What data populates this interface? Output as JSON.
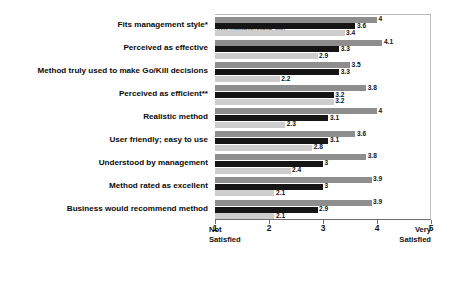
{
  "chart_data": {
    "type": "bar",
    "orientation": "horizontal",
    "title": "",
    "subtitle": "",
    "xlabel": "",
    "ylabel": "",
    "xlim": [
      1,
      5
    ],
    "xticks": [
      1,
      2,
      3,
      4,
      5
    ],
    "xtick_labels": [
      "1",
      "2",
      "3",
      "4",
      "5"
    ],
    "axis_low_label": "Not Satisfied",
    "axis_high_label": "Very Satisfied",
    "grid": false,
    "legend_position": "top-left-inside-plot",
    "categories": [
      "Fits management style*",
      "Perceived as effective",
      "Method truly used to make Go/Kill decisions",
      "Perceived as efficient**",
      "Realistic method",
      "User friendly; easy to use",
      "Understood by management",
      "Method rated as excellent",
      "Business would recommend method"
    ],
    "series": [
      {
        "name": "Top Performers(top 20%)",
        "color": "#8e8e8e",
        "values": [
          4,
          4.1,
          3.5,
          3.8,
          4,
          3.6,
          3.8,
          3.9,
          3.9
        ],
        "labels": [
          "4",
          "4.1",
          "3.5",
          "3.8",
          "4",
          "3.6",
          "3.8",
          "3.9",
          "3.9"
        ]
      },
      {
        "name": "All Businesses",
        "color": "#151515",
        "values": [
          3.6,
          3.3,
          3.3,
          3.2,
          3.1,
          3.1,
          3,
          3,
          2.9
        ],
        "labels": [
          "3.6",
          "3.3",
          "3.3",
          "3.2",
          "3.1",
          "3.1",
          "3",
          "3",
          "2.9"
        ]
      },
      {
        "name": "Poor Performers(bottom 20%)",
        "color": "#cdcdcd",
        "values": [
          3.4,
          2.9,
          2.2,
          3.2,
          2.3,
          2.8,
          2.4,
          2.1,
          2.1
        ],
        "labels": [
          "3.4",
          "2.9",
          "2.2",
          "3.2",
          "2.3",
          "2.8",
          "2.4",
          "2.1",
          "2.1"
        ]
      }
    ]
  }
}
